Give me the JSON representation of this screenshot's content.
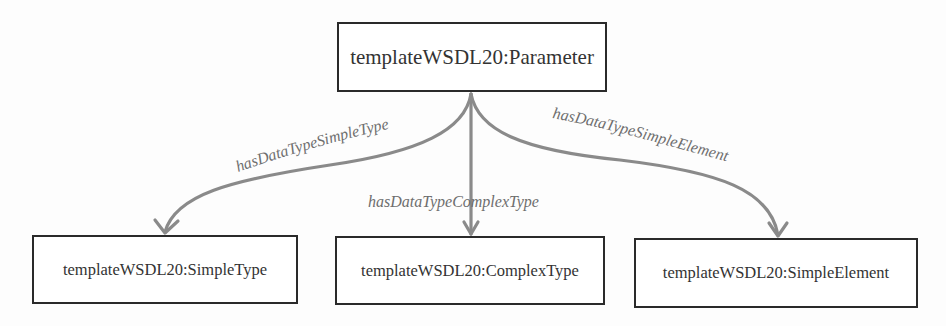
{
  "diagram": {
    "type": "ontology-relations",
    "colors": {
      "node_border": "#2a2a2a",
      "node_text": "#333333",
      "edge": "#8a8a8a",
      "edge_label": "#6e6e6e"
    },
    "root": {
      "label": "templateWSDL20:Parameter"
    },
    "children": [
      {
        "label": "templateWSDL20:SimpleType"
      },
      {
        "label": "templateWSDL20:ComplexType"
      },
      {
        "label": "templateWSDL20:SimpleElement"
      }
    ],
    "edges": [
      {
        "from": "templateWSDL20:Parameter",
        "to": "templateWSDL20:SimpleType",
        "label": "hasDataTypeSimpleType"
      },
      {
        "from": "templateWSDL20:Parameter",
        "to": "templateWSDL20:ComplexType",
        "label": "hasDataTypeComplexType"
      },
      {
        "from": "templateWSDL20:Parameter",
        "to": "templateWSDL20:SimpleElement",
        "label": "hasDataTypeSimpleElement"
      }
    ]
  }
}
